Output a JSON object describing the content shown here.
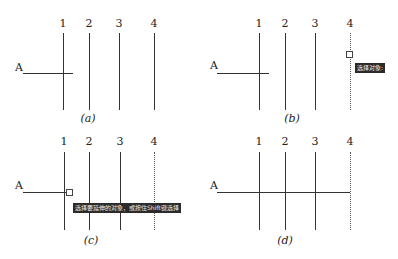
{
  "panels": [
    {
      "id": "a",
      "caption": "(a)",
      "row_label": "A",
      "axis_labels": [
        "1",
        "2",
        "3",
        "4"
      ],
      "line4_style": "solid",
      "tooltip": null
    },
    {
      "id": "b",
      "caption": "(b)",
      "row_label": "A",
      "axis_labels": [
        "1",
        "2",
        "3",
        "4"
      ],
      "line4_style": "dotted",
      "tooltip": "选择对象:"
    },
    {
      "id": "c",
      "caption": "(c)",
      "row_label": "A",
      "axis_labels": [
        "1",
        "2",
        "3",
        "4"
      ],
      "line4_style": "dotted",
      "tooltip": "选择要延伸的对象，或按住Shift键选择"
    },
    {
      "id": "d",
      "caption": "(d)",
      "row_label": "A",
      "axis_labels": [
        "1",
        "2",
        "3",
        "4"
      ],
      "line4_style": "dotted",
      "tooltip": null
    }
  ],
  "colors": {
    "line": "#333333",
    "tooltip_bg": "#2b2b2b",
    "tooltip_text": "#eeeeee"
  }
}
